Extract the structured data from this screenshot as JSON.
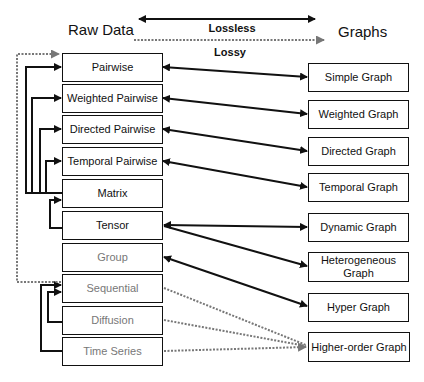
{
  "headers": {
    "raw_data": "Raw Data",
    "graphs": "Graphs",
    "lossless": "Lossless",
    "lossy": "Lossy"
  },
  "raw_data_types": [
    {
      "label": "Pairwise",
      "style": "dark"
    },
    {
      "label": "Weighted Pairwise",
      "style": "dark"
    },
    {
      "label": "Directed Pairwise",
      "style": "dark"
    },
    {
      "label": "Temporal Pairwise",
      "style": "dark"
    },
    {
      "label": "Matrix",
      "style": "dark"
    },
    {
      "label": "Tensor",
      "style": "dark"
    },
    {
      "label": "Group",
      "style": "gray"
    },
    {
      "label": "Sequential",
      "style": "gray"
    },
    {
      "label": "Diffusion",
      "style": "gray"
    },
    {
      "label": "Time Series",
      "style": "gray"
    }
  ],
  "graph_types": [
    {
      "label": "Simple Graph"
    },
    {
      "label": "Weighted Graph"
    },
    {
      "label": "Directed Graph"
    },
    {
      "label": "Temporal Graph"
    },
    {
      "label": "Dynamic Graph"
    },
    {
      "label": "Heterogeneous Graph"
    },
    {
      "label": "Hyper Graph"
    },
    {
      "label": "Higher-order Graph"
    }
  ],
  "legend": {
    "lossless_style": "solid double-headed arrow",
    "lossy_style": "dotted arrow"
  },
  "connections": [
    {
      "from": "Pairwise",
      "to": "Simple Graph",
      "type": "lossless"
    },
    {
      "from": "Weighted Pairwise",
      "to": "Weighted Graph",
      "type": "lossless"
    },
    {
      "from": "Directed Pairwise",
      "to": "Directed Graph",
      "type": "lossless"
    },
    {
      "from": "Temporal Pairwise",
      "to": "Temporal Graph",
      "type": "lossless"
    },
    {
      "from": "Tensor",
      "to": "Dynamic Graph",
      "type": "lossless"
    },
    {
      "from": "Tensor",
      "to": "Heterogeneous Graph",
      "type": "lossless"
    },
    {
      "from": "Group",
      "to": "Hyper Graph",
      "type": "lossless"
    },
    {
      "from": "Sequential",
      "to": "Higher-order Graph",
      "type": "lossy"
    },
    {
      "from": "Diffusion",
      "to": "Higher-order Graph",
      "type": "lossy"
    },
    {
      "from": "Time Series",
      "to": "Higher-order Graph",
      "type": "lossy"
    },
    {
      "from": "Matrix",
      "to": "Pairwise",
      "type": "lossless"
    },
    {
      "from": "Matrix",
      "to": "Weighted Pairwise",
      "type": "lossless"
    },
    {
      "from": "Matrix",
      "to": "Directed Pairwise",
      "type": "lossless"
    },
    {
      "from": "Matrix",
      "to": "Temporal Pairwise",
      "type": "lossless"
    },
    {
      "from": "Tensor",
      "to": "Matrix",
      "type": "lossless"
    },
    {
      "from": "Sequential",
      "to": "Pairwise",
      "type": "lossy"
    },
    {
      "from": "Diffusion",
      "to": "Sequential",
      "type": "lossless"
    },
    {
      "from": "Time Series",
      "to": "Sequential",
      "type": "lossless"
    }
  ]
}
